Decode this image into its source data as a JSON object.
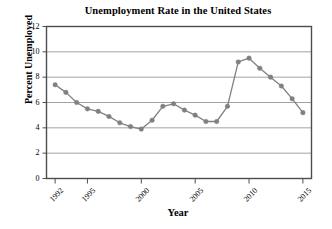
{
  "chart_data": {
    "type": "line",
    "title": "Unemployment Rate in the United States",
    "xlabel": "Year",
    "ylabel": "Percent Unemployed",
    "xlim": [
      1991.2,
      2015.8
    ],
    "ylim": [
      0,
      12
    ],
    "grid": "horizontal",
    "legend": "none",
    "marker": "circle",
    "series_color": "#808080",
    "x": [
      1992,
      1993,
      1994,
      1995,
      1996,
      1997,
      1998,
      1999,
      2000,
      2001,
      2002,
      2003,
      2004,
      2005,
      2006,
      2007,
      2008,
      2009,
      2010,
      2011,
      2012,
      2013,
      2014,
      2015
    ],
    "values": [
      7.4,
      6.8,
      6.0,
      5.5,
      5.3,
      4.9,
      4.4,
      4.1,
      3.9,
      4.6,
      5.7,
      5.9,
      5.4,
      5.0,
      4.5,
      4.5,
      5.7,
      9.2,
      9.5,
      8.7,
      8.0,
      7.3,
      6.3,
      5.2
    ],
    "xticks": [
      1992,
      1995,
      2000,
      2005,
      2010,
      2015
    ],
    "xtick_labels": [
      "1992",
      "1995",
      "2000",
      "2005",
      "2010",
      "2015"
    ],
    "yticks": [
      0,
      2,
      4,
      6,
      8,
      10,
      12
    ],
    "ytick_labels": [
      "0",
      "2",
      "4",
      "6",
      "8",
      "10",
      "12"
    ]
  },
  "axes": {
    "frame_color": "#4d4d4d",
    "grid_color": "#8c8c8c",
    "background": "#ffffff"
  }
}
